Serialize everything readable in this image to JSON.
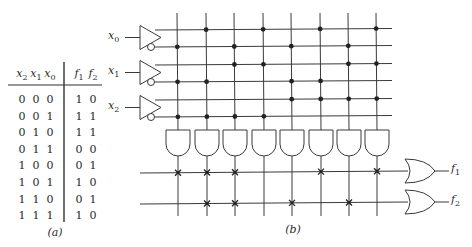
{
  "truth_table": {
    "caption": "(a)",
    "input_headers": [
      {
        "var": "x",
        "sub": "2"
      },
      {
        "var": "x",
        "sub": "1"
      },
      {
        "var": "x",
        "sub": "0"
      }
    ],
    "output_headers": [
      {
        "var": "f",
        "sub": "1"
      },
      {
        "var": "f",
        "sub": "2"
      }
    ],
    "rows": [
      {
        "x2": "0",
        "x1": "0",
        "x0": "0",
        "f1": "1",
        "f2": "0"
      },
      {
        "x2": "0",
        "x1": "0",
        "x0": "1",
        "f1": "1",
        "f2": "1"
      },
      {
        "x2": "0",
        "x1": "1",
        "x0": "0",
        "f1": "1",
        "f2": "1"
      },
      {
        "x2": "0",
        "x1": "1",
        "x0": "1",
        "f1": "0",
        "f2": "0"
      },
      {
        "x2": "1",
        "x1": "0",
        "x0": "0",
        "f1": "0",
        "f2": "1"
      },
      {
        "x2": "1",
        "x1": "0",
        "x0": "1",
        "f1": "1",
        "f2": "0"
      },
      {
        "x2": "1",
        "x1": "1",
        "x0": "0",
        "f1": "0",
        "f2": "1"
      },
      {
        "x2": "1",
        "x1": "1",
        "x0": "1",
        "f1": "1",
        "f2": "0"
      }
    ]
  },
  "circuit": {
    "caption": "(b)",
    "inputs": [
      {
        "var": "x",
        "sub": "0"
      },
      {
        "var": "x",
        "sub": "1"
      },
      {
        "var": "x",
        "sub": "2"
      }
    ],
    "outputs": [
      {
        "var": "f",
        "sub": "1"
      },
      {
        "var": "f",
        "sub": "2"
      }
    ],
    "and_plane_minterms": [
      0,
      1,
      2,
      3,
      4,
      5,
      6,
      7
    ],
    "or_plane": {
      "f1": [
        0,
        1,
        2,
        5,
        7
      ],
      "f2": [
        1,
        2,
        4,
        6
      ]
    },
    "line_color": "#3a3a3a",
    "dot_color": "#222222"
  }
}
